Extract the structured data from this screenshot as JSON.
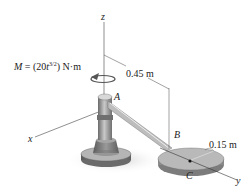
{
  "diagram": {
    "axes": {
      "x": "x",
      "y": "y",
      "z": "z"
    },
    "points": {
      "A": "A",
      "B": "B",
      "C": "C"
    },
    "moment": {
      "prefix": "M = (20t",
      "exponent": "3/2",
      "suffix": ") N·m"
    },
    "dimensions": {
      "arm_length": "0.45 m",
      "disk_radius": "0.15 m"
    },
    "colors": {
      "metal_dark": "#5f5f5f",
      "metal_mid": "#8c8c8c",
      "metal_light": "#c4c4c4",
      "shadow": "#d9d9d9",
      "line": "#333333"
    }
  }
}
